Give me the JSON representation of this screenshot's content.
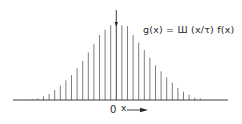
{
  "figure": {
    "formula": "g(x) = Ш (x/τ) f(x)",
    "origin_label": "0",
    "x_axis_label": "x",
    "x_arrow": "right-arrow",
    "colors": {
      "ink": "#2a2a2a",
      "bars": "#6e6e6e",
      "background": "#ffffff"
    }
  },
  "chart_data": {
    "type": "bar",
    "subtype": "impulse-train (stem)",
    "xlabel": "x",
    "ylabel": "",
    "x": [
      -15,
      -14,
      -13,
      -12,
      -11,
      -10,
      -9,
      -8,
      -7,
      -6,
      -5,
      -4,
      -3,
      -2,
      -1,
      0,
      1,
      2,
      3,
      4,
      5,
      6,
      7,
      8,
      9,
      10,
      11,
      12,
      13,
      14,
      15
    ],
    "x_units": "multiples of τ",
    "values": [
      0.01,
      0.02,
      0.05,
      0.08,
      0.13,
      0.19,
      0.26,
      0.33,
      0.42,
      0.52,
      0.63,
      0.74,
      0.86,
      0.93,
      0.99,
      1.0,
      0.99,
      0.98,
      0.86,
      0.76,
      0.66,
      0.56,
      0.46,
      0.38,
      0.3,
      0.23,
      0.16,
      0.11,
      0.07,
      0.03,
      0.02
    ],
    "ylim": [
      0,
      1.15
    ],
    "tick_labels": {
      "x": [
        "0"
      ]
    },
    "grid": false,
    "legend": null,
    "annotations": [
      "g(x) = Ш(x/τ) f(x)",
      "0",
      "x →"
    ]
  }
}
